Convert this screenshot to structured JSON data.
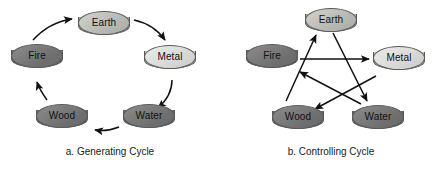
{
  "figure": {
    "background_color": "#ffffff"
  },
  "panels": [
    {
      "id": "generating-cycle",
      "caption": "a. Generating Cycle",
      "nodes": [
        {
          "id": "earth",
          "label": "Earth",
          "tone": "mid",
          "x": 78,
          "y": 11
        },
        {
          "id": "metal",
          "label": "Metal",
          "tone": "light",
          "x": 144,
          "y": 45
        },
        {
          "id": "water",
          "label": "Water",
          "tone": "dark",
          "x": 123,
          "y": 104
        },
        {
          "id": "wood",
          "label": "Wood",
          "tone": "dark",
          "x": 36,
          "y": 104
        },
        {
          "id": "fire",
          "label": "Fire",
          "tone": "dark",
          "x": 11,
          "y": 44
        }
      ],
      "edges": [
        {
          "id": "fire-to-earth",
          "from": "fire",
          "to": "earth",
          "style": "curved"
        },
        {
          "id": "earth-to-metal",
          "from": "earth",
          "to": "metal",
          "style": "curved"
        },
        {
          "id": "metal-to-water",
          "from": "metal",
          "to": "water",
          "style": "curved"
        },
        {
          "id": "water-to-wood",
          "from": "water",
          "to": "wood",
          "style": "curved"
        },
        {
          "id": "wood-to-fire",
          "from": "wood",
          "to": "fire",
          "style": "curved"
        }
      ]
    },
    {
      "id": "controlling-cycle",
      "caption": "b. Controlling Cycle",
      "nodes": [
        {
          "id": "earth",
          "label": "Earth",
          "tone": "mid",
          "x": 84,
          "y": 8
        },
        {
          "id": "fire",
          "label": "Fire",
          "tone": "dark",
          "x": 25,
          "y": 44
        },
        {
          "id": "metal",
          "label": "Metal",
          "tone": "light",
          "x": 152,
          "y": 46
        },
        {
          "id": "wood",
          "label": "Wood",
          "tone": "dark",
          "x": 51,
          "y": 105
        },
        {
          "id": "water",
          "label": "Water",
          "tone": "dark",
          "x": 131,
          "y": 105
        }
      ],
      "edges": [
        {
          "id": "fire-to-metal",
          "from": "fire",
          "to": "metal",
          "style": "straight"
        },
        {
          "id": "earth-to-water",
          "from": "earth",
          "to": "water",
          "style": "straight"
        },
        {
          "id": "water-to-fire",
          "from": "water",
          "to": "fire",
          "style": "straight"
        },
        {
          "id": "metal-to-wood",
          "from": "metal",
          "to": "wood",
          "style": "straight"
        },
        {
          "id": "wood-to-earth",
          "from": "wood",
          "to": "earth",
          "style": "straight"
        }
      ]
    }
  ]
}
